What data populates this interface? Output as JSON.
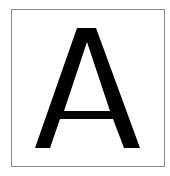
{
  "card": {
    "letter": "A",
    "letter_color": "#000000",
    "border_color": "#8a8a8a",
    "background": "#ffffff"
  }
}
